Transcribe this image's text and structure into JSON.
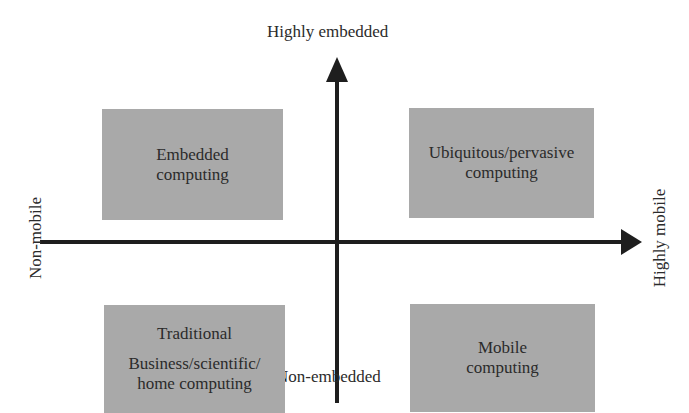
{
  "diagram": {
    "type": "quadrant",
    "axes": {
      "vertical": {
        "top_label": "Highly embedded",
        "bottom_label": "Non-embedded"
      },
      "horizontal": {
        "left_label": "Non-mobile",
        "right_label": "Highly mobile"
      }
    },
    "quadrants": {
      "top_left": {
        "lines": [
          "Embedded",
          "computing"
        ]
      },
      "top_right": {
        "lines": [
          "Ubiquitous/pervasive",
          "computing"
        ]
      },
      "bottom_left": {
        "title": "Traditional",
        "lines": [
          "Business/scientific/",
          "home computing"
        ]
      },
      "bottom_right": {
        "lines": [
          "Mobile",
          "computing"
        ]
      }
    },
    "colors": {
      "box_fill": "#a9a9a9",
      "axis": "#1e1e1e",
      "text": "#2b2b2b",
      "background": "#ffffff"
    }
  }
}
